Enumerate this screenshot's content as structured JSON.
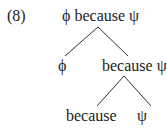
{
  "example_number": "(8)",
  "tree": {
    "root": "ϕ because ψ",
    "level1": {
      "left": "ϕ",
      "right": "because ψ"
    },
    "level2": {
      "left": "because",
      "right": "ψ"
    }
  }
}
